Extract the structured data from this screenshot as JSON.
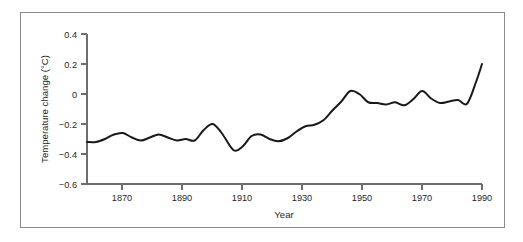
{
  "figure": {
    "frame_color": "#8a8a8a",
    "background_color": "#ffffff"
  },
  "chart_data": {
    "type": "line",
    "title": "",
    "xlabel": "Year",
    "ylabel": "Temperature change (°C)",
    "xlim": [
      1858,
      1990
    ],
    "ylim": [
      -0.6,
      0.4
    ],
    "xticks": [
      1870,
      1890,
      1910,
      1930,
      1950,
      1970,
      1990
    ],
    "xtick_labels": [
      "1870",
      "1890",
      "1910",
      "1930",
      "1950",
      "1970",
      "1990"
    ],
    "yticks": [
      -0.6,
      -0.4,
      -0.2,
      0,
      0.2,
      0.4
    ],
    "ytick_labels": [
      "−0.6",
      "−0.4",
      "−0.2",
      "0",
      "0.2",
      "0.4"
    ],
    "grid": false,
    "legend": null,
    "line_color": "#191919",
    "series": [
      {
        "name": "Global mean temperature change",
        "x": [
          1858,
          1861,
          1864,
          1867,
          1870,
          1873,
          1876,
          1879,
          1882,
          1885,
          1888,
          1891,
          1894,
          1897,
          1900,
          1903,
          1907,
          1910,
          1913,
          1916,
          1919,
          1922,
          1925,
          1928,
          1931,
          1934,
          1937,
          1940,
          1943,
          1946,
          1949,
          1952,
          1955,
          1958,
          1961,
          1964,
          1967,
          1970,
          1973,
          1976,
          1979,
          1982,
          1985,
          1988,
          1990
        ],
        "y": [
          -0.32,
          -0.32,
          -0.3,
          -0.27,
          -0.26,
          -0.29,
          -0.31,
          -0.29,
          -0.27,
          -0.29,
          -0.31,
          -0.3,
          -0.31,
          -0.24,
          -0.2,
          -0.26,
          -0.375,
          -0.35,
          -0.28,
          -0.27,
          -0.3,
          -0.315,
          -0.295,
          -0.25,
          -0.215,
          -0.205,
          -0.175,
          -0.11,
          -0.05,
          0.02,
          0.0,
          -0.055,
          -0.06,
          -0.07,
          -0.055,
          -0.075,
          -0.035,
          0.02,
          -0.03,
          -0.06,
          -0.05,
          -0.04,
          -0.065,
          0.08,
          0.2
        ],
        "notes": "Smoothed global mean surface temperature anomaly; values read from the curve against the 0.2 °C gridline spacing."
      }
    ],
    "annotations": {
      "minimum": {
        "year": 1907,
        "value": -0.375
      },
      "maximum": {
        "year": 1990,
        "value": 0.2
      },
      "mid_century_peak": {
        "year": 1943,
        "value": 0.02
      },
      "start": {
        "year": 1858,
        "value": -0.32
      }
    }
  }
}
